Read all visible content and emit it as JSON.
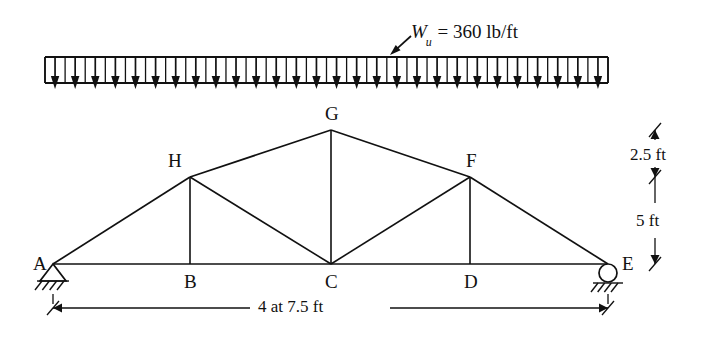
{
  "figure": {
    "type": "structural-truss-diagram",
    "title_label": "",
    "background": "#ffffff",
    "ink_color": "#111111"
  },
  "load": {
    "symbol": "W",
    "subscript": "u",
    "equals": "=",
    "magnitude": "360",
    "units": "lb/ft",
    "full_text": "W_u = 360 lb/ft",
    "arrow_count": 28,
    "direction": "down",
    "box": {
      "x1": 45,
      "x2": 608,
      "y_top": 57,
      "y_bottom": 83
    },
    "leader": {
      "x1": 411,
      "y1": 36,
      "x2": 390,
      "y2": 55
    }
  },
  "truss": {
    "joints": [
      {
        "id": "A",
        "label": "A",
        "x": 53,
        "y": 264,
        "label_dx": -20,
        "label_dy": -10,
        "support": "pin"
      },
      {
        "id": "B",
        "label": "B",
        "x": 190,
        "y": 264,
        "label_dx": -6,
        "label_dy": 8,
        "support": "none"
      },
      {
        "id": "C",
        "label": "C",
        "x": 331,
        "y": 264,
        "label_dx": -6,
        "label_dy": 8,
        "support": "none"
      },
      {
        "id": "D",
        "label": "D",
        "x": 470,
        "y": 264,
        "label_dx": -6,
        "label_dy": 8,
        "support": "none"
      },
      {
        "id": "E",
        "label": "E",
        "x": 608,
        "y": 264,
        "label_dx": 14,
        "label_dy": -10,
        "support": "roller"
      },
      {
        "id": "F",
        "label": "F",
        "x": 470,
        "y": 177,
        "label_dx": -4,
        "label_dy": -26,
        "support": "none"
      },
      {
        "id": "G",
        "label": "G",
        "x": 331,
        "y": 130,
        "label_dx": -6,
        "label_dy": -26,
        "support": "none"
      },
      {
        "id": "H",
        "label": "H",
        "x": 190,
        "y": 177,
        "label_dx": -22,
        "label_dy": -26,
        "support": "none"
      }
    ],
    "members": [
      {
        "from": "A",
        "to": "B",
        "kind": "bottom-chord"
      },
      {
        "from": "B",
        "to": "C",
        "kind": "bottom-chord"
      },
      {
        "from": "C",
        "to": "D",
        "kind": "bottom-chord"
      },
      {
        "from": "D",
        "to": "E",
        "kind": "bottom-chord"
      },
      {
        "from": "A",
        "to": "H",
        "kind": "top-chord"
      },
      {
        "from": "H",
        "to": "G",
        "kind": "top-chord"
      },
      {
        "from": "G",
        "to": "F",
        "kind": "top-chord"
      },
      {
        "from": "F",
        "to": "E",
        "kind": "top-chord"
      },
      {
        "from": "H",
        "to": "B",
        "kind": "vertical"
      },
      {
        "from": "G",
        "to": "C",
        "kind": "vertical"
      },
      {
        "from": "F",
        "to": "D",
        "kind": "vertical"
      },
      {
        "from": "H",
        "to": "C",
        "kind": "diagonal"
      },
      {
        "from": "C",
        "to": "F",
        "kind": "diagonal"
      }
    ]
  },
  "dimensions": {
    "span": {
      "text": "4 at 7.5 ft",
      "x1": 53,
      "x2": 608,
      "y": 308,
      "gap_left": 250,
      "gap_right": 390
    },
    "height_upper": {
      "text": "2.5 ft",
      "x": 655,
      "y_top": 130,
      "y_bottom": 177,
      "label_x": 630,
      "label_y": 146
    },
    "height_lower": {
      "text": "5 ft",
      "x": 655,
      "y_top": 177,
      "y_bottom": 264,
      "label_x": 636,
      "label_y": 212
    }
  },
  "supports": {
    "pin": {
      "joint": "A",
      "name": "pinned-support",
      "hatch_count": 4
    },
    "roller": {
      "joint": "E",
      "name": "roller-support",
      "radius": 9,
      "hatch_count": 4
    }
  }
}
